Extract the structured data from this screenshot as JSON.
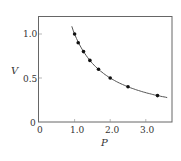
{
  "chart_data": {
    "type": "scatter",
    "title": "",
    "xlabel": "P",
    "ylabel": "V",
    "xlim": [
      0,
      3.7
    ],
    "ylim": [
      0,
      1.2
    ],
    "x_ticks": [
      "0",
      "1.0",
      "2.0",
      "3.0"
    ],
    "y_ticks": [
      "0",
      "0.5",
      "1.0"
    ],
    "grid": false,
    "legend": null,
    "series": [
      {
        "name": "data points",
        "style": "markers",
        "x": [
          1.0,
          1.1,
          1.25,
          1.43,
          1.67,
          2.0,
          2.5,
          3.33
        ],
        "y": [
          1.0,
          0.9,
          0.8,
          0.7,
          0.6,
          0.5,
          0.4,
          0.3
        ]
      },
      {
        "name": "fit curve V = 1/P",
        "style": "line",
        "x_range": [
          0.92,
          3.6
        ]
      }
    ]
  },
  "colors": {
    "frame": "#666666",
    "curve": "#555555",
    "marker": "#111111"
  }
}
